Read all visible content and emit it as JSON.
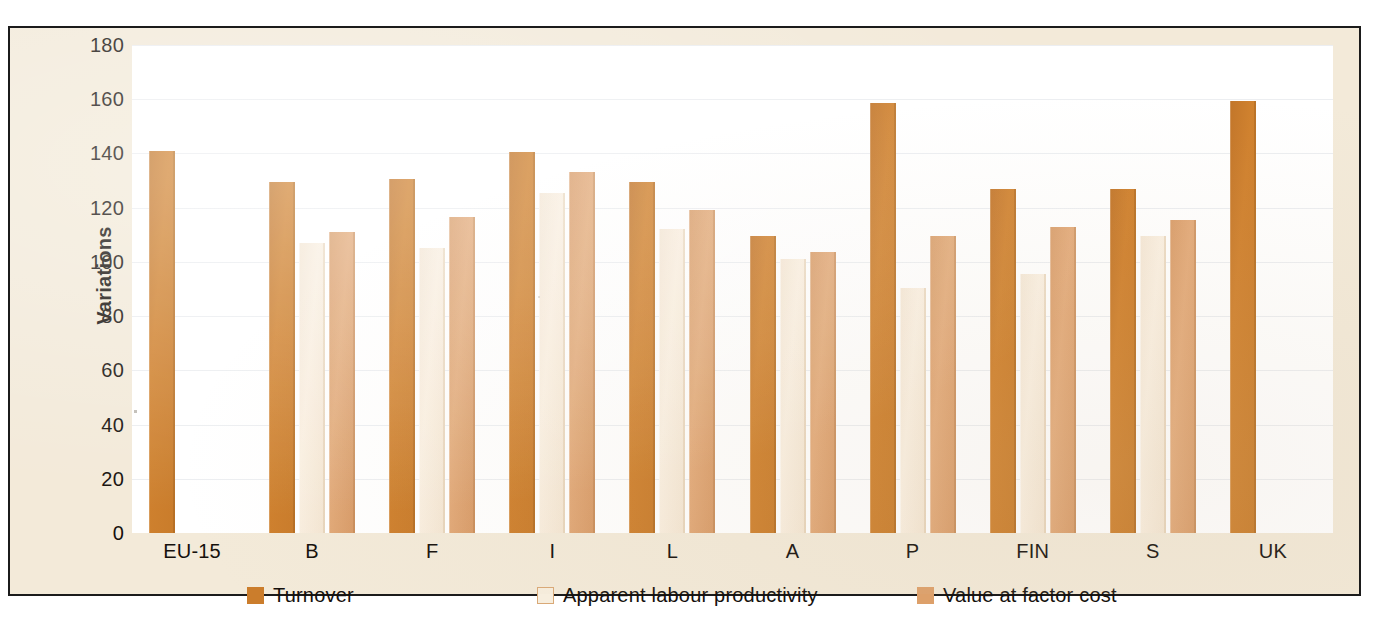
{
  "chart_data": {
    "type": "bar",
    "title": "",
    "xlabel": "",
    "ylabel": "Variations",
    "ylim": [
      0,
      180
    ],
    "yticks": [
      0,
      20,
      40,
      60,
      80,
      100,
      120,
      140,
      160,
      180
    ],
    "ytick_labels": [
      "0",
      "20",
      "40",
      "60",
      "80",
      "100",
      "120",
      "140",
      "160",
      "180"
    ],
    "categories": [
      "EU-15",
      "B",
      "F",
      "I",
      "L",
      "A",
      "P",
      "FIN",
      "S",
      "UK"
    ],
    "grid": true,
    "legend_position": "bottom",
    "series": [
      {
        "name": "Turnover",
        "color": "#cb7d2c",
        "values": [
          141,
          129.5,
          130.5,
          140.5,
          129.5,
          109.5,
          158.5,
          127,
          127,
          159.5
        ]
      },
      {
        "name": "Apparent labour productivity",
        "color": "#f7eede",
        "values": [
          null,
          107,
          105,
          125.5,
          112,
          101,
          90.5,
          95.5,
          109.5,
          null
        ]
      },
      {
        "name": "Value at factor cost",
        "color": "#dda06a",
        "values": [
          null,
          111,
          116.5,
          133,
          119,
          103.5,
          109.5,
          113,
          115.5,
          null
        ]
      }
    ]
  },
  "legend": {
    "items": [
      {
        "label": "Turnover",
        "swatch": "turnover"
      },
      {
        "label": "Apparent labour productivity",
        "swatch": "productivity"
      },
      {
        "label": "Value at factor cost",
        "swatch": "factorcost"
      }
    ]
  }
}
